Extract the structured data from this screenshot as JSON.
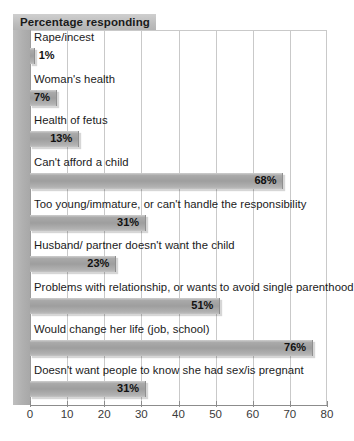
{
  "chart_data": {
    "type": "bar",
    "orientation": "horizontal",
    "title": "Percentage responding",
    "xlabel": "",
    "ylabel": "",
    "xlim": [
      0,
      80
    ],
    "xticks": [
      0,
      10,
      20,
      30,
      40,
      50,
      60,
      70,
      80
    ],
    "grid": true,
    "legend": false,
    "value_suffix": "%",
    "categories": [
      "Rape/incest",
      "Woman's health",
      "Health of fetus",
      "Can't afford a child",
      "Too young/immature, or can't handle the responsibility",
      "Husband/ partner doesn't want the child",
      "Problems with relationship, or wants to avoid single parenthood",
      "Would change her life (job, school)",
      "Doesn't want people to know she had sex/is pregnant"
    ],
    "values": [
      1,
      7,
      13,
      68,
      31,
      23,
      51,
      76,
      31
    ],
    "value_labels": [
      "1%",
      "7%",
      "13%",
      "68%",
      "31%",
      "23%",
      "51%",
      "76%",
      "31%"
    ],
    "label_placement": [
      "outside",
      "inside",
      "inside",
      "inside",
      "inside",
      "inside",
      "inside",
      "inside",
      "inside"
    ],
    "tick_labels": [
      "0",
      "10",
      "20",
      "30",
      "40",
      "50",
      "60",
      "70",
      "80"
    ],
    "colors": {
      "bar": "#9e9e9e",
      "bar_highlight": "#cfcfcf",
      "grid": "#c9c9c9",
      "axis": "#8c8c8c",
      "band": "#b3b3b3",
      "title_box": "#c2c2c2",
      "text": "#1a1a1a",
      "background": "#ffffff"
    }
  }
}
